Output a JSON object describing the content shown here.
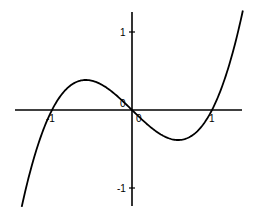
{
  "chart_data": {
    "type": "line",
    "title": "",
    "function": "y = x^3 - x",
    "xlabel": "",
    "ylabel": "",
    "xlim": [
      -1.45,
      1.4
    ],
    "ylim": [
      -1.25,
      1.25
    ],
    "grid": false,
    "legend": null,
    "x_ticks": [
      {
        "value": -1,
        "label": "-1"
      },
      {
        "value": 0,
        "label": "0"
      },
      {
        "value": 1,
        "label": "1"
      }
    ],
    "y_ticks": [
      {
        "value": 1,
        "label": "1"
      },
      {
        "value": 0,
        "label": "0"
      },
      {
        "value": -1,
        "label": "-1"
      }
    ],
    "series": [
      {
        "name": "f(x)",
        "color": "#000000",
        "x": [
          -1.45,
          -1.3,
          -1.0,
          -0.8,
          -0.577,
          -0.4,
          -0.2,
          0,
          0.2,
          0.4,
          0.577,
          0.8,
          1.0,
          1.2,
          1.4
        ],
        "y": [
          -1.6,
          -0.9,
          0.0,
          0.288,
          0.385,
          0.336,
          0.192,
          0,
          -0.192,
          -0.336,
          -0.385,
          -0.288,
          0.0,
          0.528,
          1.344
        ]
      }
    ]
  },
  "labels": {
    "x_neg1": "-1",
    "x_0": "0",
    "x_1": "1",
    "y_1": "1",
    "y_0": "0",
    "y_neg1": "-1"
  }
}
